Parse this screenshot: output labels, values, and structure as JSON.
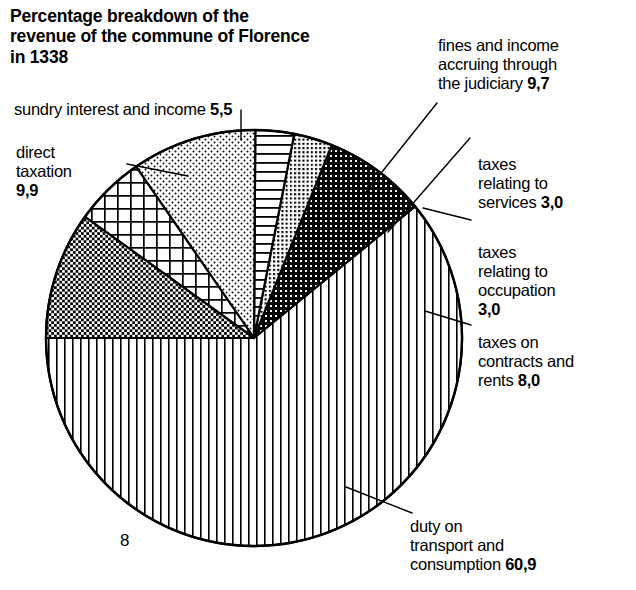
{
  "title": "Percentage breakdown of the\nrevenue of the commune of\nFlorence in 1338",
  "page_number": "8",
  "labels": {
    "sundry": {
      "text": "sundry interest and income ",
      "value": "5,5"
    },
    "direct": {
      "text": "direct\ntaxation\n",
      "value": "9,9"
    },
    "fines": {
      "text": "fines and income\naccruing through\nthe judiciary ",
      "value": "9,7"
    },
    "services": {
      "text": "taxes\nrelating to\nservices ",
      "value": "3,0"
    },
    "occupation": {
      "text": "taxes\nrelating to\noccupation\n",
      "value": "3,0"
    },
    "contracts": {
      "text": "taxes on\ncontracts and\nrents ",
      "value": "8,0"
    },
    "duty": {
      "text": "duty on\ntransport and\nconsumption ",
      "value": "60,9"
    }
  },
  "chart_data": {
    "type": "pie",
    "title": "Percentage breakdown of the revenue of the commune of Florence in 1338",
    "unit": "percent",
    "total": 100.0,
    "legend_position": "callouts",
    "categories": [
      "duty on transport and consumption",
      "taxes on contracts and rents",
      "taxes relating to occupation",
      "taxes relating to services",
      "fines and income accruing through the judiciary",
      "sundry interest and income",
      "direct taxation"
    ],
    "values": [
      60.9,
      8.0,
      3.0,
      3.0,
      9.7,
      5.5,
      9.9
    ],
    "value_labels": [
      "60,9",
      "8,0",
      "3,0",
      "3,0",
      "9,7",
      "5,5",
      "9,9"
    ],
    "slices": [
      {
        "name": "duty on transport and consumption",
        "value": 60.9,
        "label": "60,9",
        "pattern": "vertical-lines",
        "start_deg": 180.0,
        "sweep_deg": 219.24
      },
      {
        "name": "taxes on contracts and rents",
        "value": 8.0,
        "label": "8,0",
        "pattern": "dense-checker-dark",
        "start_deg": 39.24,
        "sweep_deg": 28.8
      },
      {
        "name": "taxes relating to occupation",
        "value": 3.0,
        "label": "3,0",
        "pattern": "fine-dot-grid",
        "start_deg": 68.04,
        "sweep_deg": 10.8
      },
      {
        "name": "taxes relating to services",
        "value": 3.0,
        "label": "3,0",
        "pattern": "horizontal-lines",
        "start_deg": 78.84,
        "sweep_deg": 10.8
      },
      {
        "name": "fines and income accruing through the judiciary",
        "value": 9.7,
        "label": "9,7",
        "pattern": "light-stipple",
        "start_deg": 89.64,
        "sweep_deg": 34.92
      },
      {
        "name": "sundry interest and income",
        "value": 5.5,
        "label": "5,5",
        "pattern": "square-grid",
        "start_deg": 124.56,
        "sweep_deg": 19.8
      },
      {
        "name": "direct taxation",
        "value": 9.9,
        "label": "9,9",
        "pattern": "medium-checker",
        "start_deg": 144.36,
        "sweep_deg": 35.64
      }
    ],
    "geometry": {
      "cx": 254,
      "cy": 338,
      "r": 208
    },
    "colors": {
      "stroke": "#000000",
      "fill": "#ffffff",
      "pattern": "#000000"
    }
  }
}
